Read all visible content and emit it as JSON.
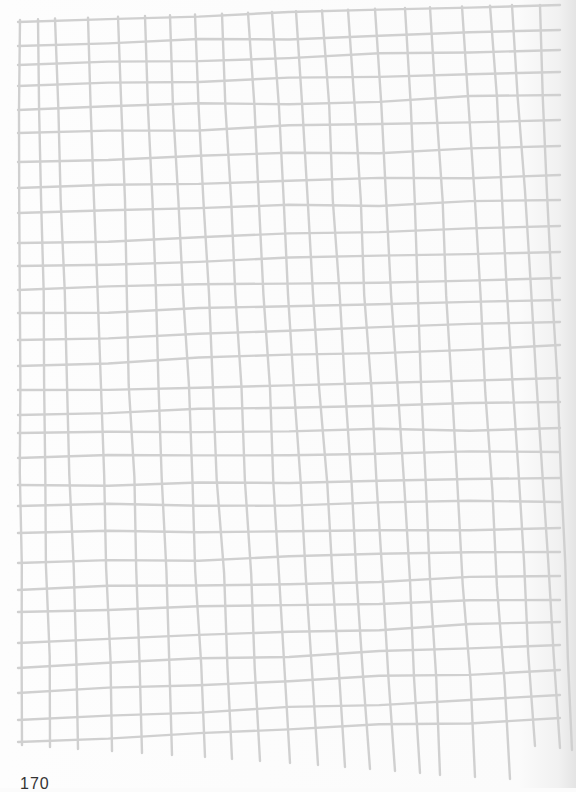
{
  "page": {
    "number": "170",
    "grid_color": "#d0d0d0",
    "background": "#fbfbfb"
  },
  "grid": {
    "style": "hand-drawn",
    "vertical_lines_x_top": [
      20,
      38,
      55,
      88,
      118,
      145,
      170,
      195,
      222,
      248,
      272,
      296,
      322,
      348,
      375,
      405,
      430,
      462,
      490,
      512,
      540
    ],
    "vertical_lines_x_bottom": [
      22,
      50,
      78,
      112,
      142,
      172,
      205,
      232,
      260,
      290,
      318,
      345,
      370,
      395,
      420,
      440,
      475,
      510,
      535,
      560,
      572
    ],
    "horizontal_lines_y_left": [
      22,
      46,
      65,
      86,
      110,
      133,
      162,
      188,
      213,
      243,
      266,
      290,
      313,
      340,
      366,
      390,
      415,
      433,
      458,
      485,
      506,
      533,
      563,
      590,
      612,
      643,
      668,
      693,
      720,
      742
    ],
    "horizontal_lines_y_right": [
      5,
      30,
      50,
      72,
      95,
      120,
      146,
      175,
      200,
      226,
      252,
      278,
      300,
      322,
      345,
      378,
      402,
      428,
      452,
      478,
      502,
      528,
      552,
      576,
      600,
      622,
      645,
      670,
      695,
      718
    ]
  }
}
